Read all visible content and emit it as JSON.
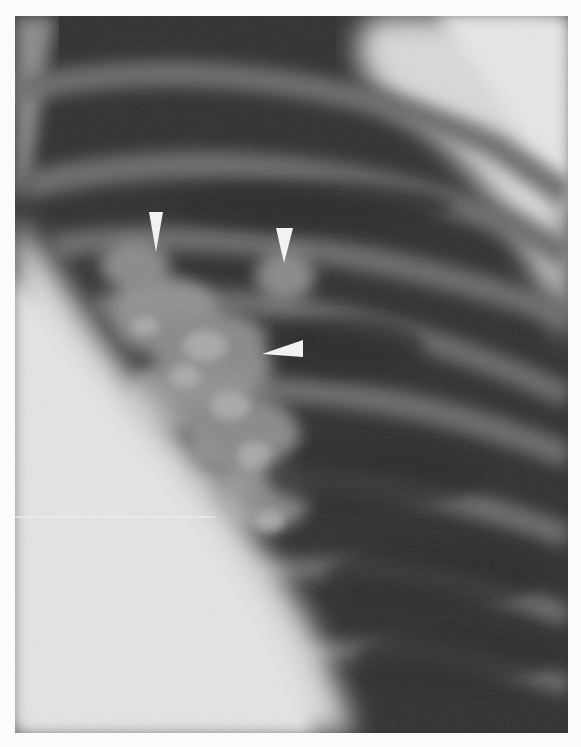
{
  "image": {
    "kind": "radiograph",
    "description": "Grayscale chest X-ray, oblique view of ribs and lung field with heart shadow at lower left",
    "annotations": [
      {
        "type": "arrowhead",
        "direction": "down",
        "tip": [
          156,
          252
        ]
      },
      {
        "type": "arrowhead",
        "direction": "down",
        "tip": [
          284,
          263
        ]
      },
      {
        "type": "arrowhead",
        "direction": "left",
        "tip": [
          262,
          354
        ]
      }
    ],
    "colors": {
      "border": "#fbfbfb",
      "lung_dark": "#2e2e2e",
      "rib_band": "#6a6a6a",
      "soft_tissue": "#dcdcdc",
      "arrowhead": "#f2f2f2"
    }
  }
}
